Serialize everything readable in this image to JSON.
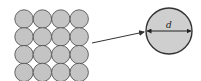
{
  "diagram": {
    "grid": {
      "rows": 4,
      "cols": 4,
      "cx0": 24,
      "cy0": 19,
      "pitch_x": 18.4,
      "pitch_y": 17.8,
      "r": 9.2,
      "fill": "#c4c4c4",
      "stroke": "#555555"
    },
    "detail_circle": {
      "cx": 169,
      "cy": 31,
      "r": 23,
      "fill": "#cfcfcf",
      "stroke": "#333333"
    },
    "arrow": {
      "x1": 92,
      "y1": 43,
      "x2": 144,
      "y2": 32,
      "color": "#333333"
    },
    "dimension_label": "d"
  }
}
